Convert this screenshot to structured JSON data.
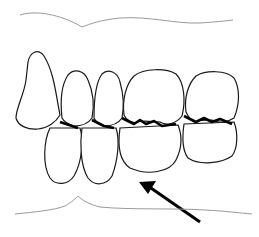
{
  "diagram": {
    "upper_teeth_count": 5,
    "lower_teeth_count": 4,
    "annotation": "arrow pointing up-left toward lower teeth",
    "colors": {
      "background": "#ffffff",
      "outline": "#1a1a1a",
      "gum_line": "#9a9a9a",
      "arrow": "#000000"
    }
  }
}
